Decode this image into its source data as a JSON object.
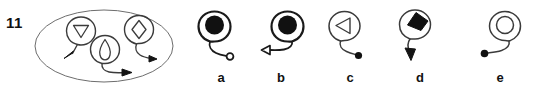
{
  "item": {
    "number": "11",
    "type": "non-verbal-reasoning-figure-series"
  },
  "colors": {
    "ink": "#1a1a1a",
    "outline": "#3b3b3b",
    "fill_solid": "#111111",
    "fill_hollow": "#ffffff",
    "background": "#ffffff"
  },
  "stem": {
    "container_shape": "ellipse",
    "figures": [
      {
        "name": "figure-triangle-down",
        "inner_shape": "triangle-down",
        "inner_fill": "hollow",
        "tail_direction": "down-left",
        "tail_terminal": "solid-arrowhead"
      },
      {
        "name": "figure-diamond",
        "inner_shape": "diamond",
        "inner_fill": "hollow",
        "tail_direction": "down-right",
        "tail_terminal": "solid-arrowhead"
      },
      {
        "name": "figure-teardrop",
        "inner_shape": "teardrop",
        "inner_fill": "hollow",
        "tail_direction": "down-right",
        "tail_terminal": "solid-arrowhead"
      }
    ]
  },
  "options": [
    {
      "label": "a",
      "name": "option-a",
      "inner_shape": "circle",
      "inner_fill": "solid",
      "tail_direction": "down-right",
      "tail_terminal": "hollow-circle"
    },
    {
      "label": "b",
      "name": "option-b",
      "inner_shape": "circle",
      "inner_fill": "solid",
      "tail_direction": "down-left",
      "tail_terminal": "hollow-triangle"
    },
    {
      "label": "c",
      "name": "option-c",
      "inner_shape": "triangle-left",
      "inner_fill": "hollow",
      "tail_direction": "down-right",
      "tail_terminal": "solid-dot"
    },
    {
      "label": "d",
      "name": "option-d",
      "inner_shape": "diamond",
      "inner_fill": "solid",
      "tail_direction": "down-left",
      "tail_terminal": "solid-arrowhead"
    },
    {
      "label": "e",
      "name": "option-e",
      "inner_shape": "circle",
      "inner_fill": "hollow",
      "tail_direction": "down-left",
      "tail_terminal": "solid-dot"
    }
  ]
}
